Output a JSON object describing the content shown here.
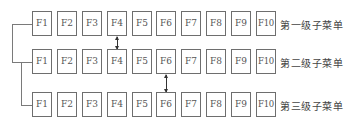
{
  "diagram": {
    "menus": [
      {
        "label": "第一级子菜单",
        "keys": [
          "F1",
          "F2",
          "F3",
          "F4",
          "F5",
          "F6",
          "F7",
          "F8",
          "F9",
          "F10"
        ]
      },
      {
        "label": "第二级子菜单",
        "keys": [
          "F1",
          "F2",
          "F3",
          "F4",
          "F5",
          "F6",
          "F7",
          "F8",
          "F9",
          "F10"
        ]
      },
      {
        "label": "第三级子菜单",
        "keys": [
          "F1",
          "F2",
          "F3",
          "F4",
          "F5",
          "F6",
          "F7",
          "F8",
          "F9",
          "F10"
        ]
      }
    ],
    "links": [
      {
        "from_row": 1,
        "to_row": 2,
        "key": "F4"
      },
      {
        "from_row": 2,
        "to_row": 3,
        "key": "F6"
      }
    ],
    "colors": {
      "box_border": "#6e6e6e",
      "line": "#7a7a7a",
      "arrow": "#333333",
      "text": "#555555"
    }
  }
}
